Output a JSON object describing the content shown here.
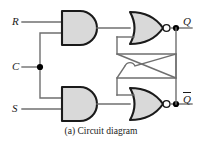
{
  "figure": {
    "caption": "(a) Circuit diagram",
    "type": "logic-circuit-schematic",
    "circuit_name": "Clocked SR latch (gated SR flip-flop)"
  },
  "colors": {
    "gate_fill": "#d9d9d9",
    "gate_stroke": "#1a1a1a",
    "wire": "#6f6f6f",
    "junction": "#000000",
    "background": "#ffffff",
    "text": "#1a1a1a"
  },
  "inputs": [
    {
      "id": "R",
      "label": "R",
      "y": 22
    },
    {
      "id": "C",
      "label": "C",
      "y": 67
    },
    {
      "id": "S",
      "label": "S",
      "y": 109
    }
  ],
  "outputs": [
    {
      "id": "Q",
      "label": "Q",
      "overbar": false,
      "y": 22
    },
    {
      "id": "Qbar",
      "label": "Q",
      "overbar": true,
      "y": 98
    }
  ],
  "gates": [
    {
      "id": "and-top",
      "type": "AND",
      "label": "AND",
      "inputs": [
        "R",
        "C"
      ],
      "output": "nor-top.in1"
    },
    {
      "id": "and-bottom",
      "type": "AND",
      "label": "AND",
      "inputs": [
        "S",
        "C"
      ],
      "output": "nor-bottom.in2"
    },
    {
      "id": "nor-top",
      "type": "NOR",
      "label": "NOR",
      "inverted_output": true,
      "inputs": [
        "and-top.out",
        "Qbar-feedback"
      ],
      "output": "Q"
    },
    {
      "id": "nor-bottom",
      "type": "NOR",
      "label": "NOR",
      "inverted_output": true,
      "inputs": [
        "Q-feedback",
        "and-bottom.out"
      ],
      "output": "Qbar"
    }
  ],
  "junctions": [
    {
      "id": "c-fanout",
      "x": 40,
      "y": 67
    },
    {
      "id": "q-tap",
      "x": 176,
      "y": 22
    },
    {
      "id": "qbar-tap",
      "x": 176,
      "y": 98
    }
  ],
  "wire_crossing": {
    "id": "feedback-crossover",
    "style": "hop",
    "connected": false,
    "x": 130,
    "y": 60
  }
}
